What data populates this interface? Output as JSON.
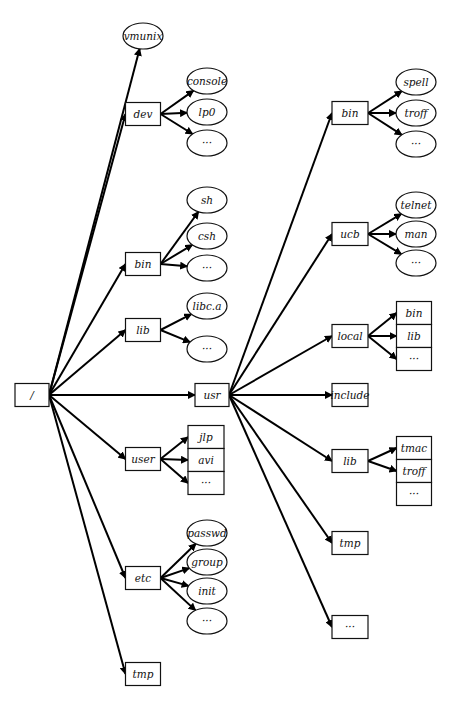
{
  "diagram": {
    "type": "unix-filesystem-tree",
    "root": {
      "id": "root",
      "label": "/",
      "shape": "box",
      "x": 32,
      "y": 395,
      "w": 34,
      "h": 23
    },
    "nodes": [
      {
        "id": "vmunix",
        "label": "vmunix",
        "shape": "ellipse",
        "x": 143,
        "y": 36,
        "w": 40,
        "h": 26,
        "parent": "root"
      },
      {
        "id": "dev",
        "label": "dev",
        "shape": "box",
        "x": 143,
        "y": 114,
        "w": 35,
        "h": 23,
        "parent": "root"
      },
      {
        "id": "dev-console",
        "label": "console",
        "shape": "ellipse",
        "x": 207,
        "y": 81,
        "w": 40,
        "h": 26,
        "parent": "dev"
      },
      {
        "id": "dev-lp0",
        "label": "lp0",
        "shape": "ellipse",
        "x": 207,
        "y": 112,
        "w": 40,
        "h": 26,
        "parent": "dev"
      },
      {
        "id": "dev-more",
        "label": "···",
        "shape": "ellipse",
        "x": 207,
        "y": 143,
        "w": 40,
        "h": 26,
        "parent": "dev"
      },
      {
        "id": "bin",
        "label": "bin",
        "shape": "box",
        "x": 143,
        "y": 264,
        "w": 35,
        "h": 23,
        "parent": "root"
      },
      {
        "id": "bin-sh",
        "label": "sh",
        "shape": "ellipse",
        "x": 207,
        "y": 200,
        "w": 40,
        "h": 26,
        "parent": "bin"
      },
      {
        "id": "bin-csh",
        "label": "csh",
        "shape": "ellipse",
        "x": 207,
        "y": 236,
        "w": 40,
        "h": 26,
        "parent": "bin"
      },
      {
        "id": "bin-more",
        "label": "···",
        "shape": "ellipse",
        "x": 207,
        "y": 268,
        "w": 40,
        "h": 26,
        "parent": "bin"
      },
      {
        "id": "lib",
        "label": "lib",
        "shape": "box",
        "x": 143,
        "y": 330,
        "w": 35,
        "h": 23,
        "parent": "root"
      },
      {
        "id": "lib-libca",
        "label": "libc.a",
        "shape": "ellipse",
        "x": 207,
        "y": 306,
        "w": 40,
        "h": 26,
        "parent": "lib"
      },
      {
        "id": "lib-more",
        "label": "···",
        "shape": "ellipse",
        "x": 207,
        "y": 349,
        "w": 40,
        "h": 26,
        "parent": "lib"
      },
      {
        "id": "usr",
        "label": "usr",
        "shape": "box",
        "x": 212,
        "y": 395,
        "w": 34,
        "h": 23,
        "parent": "root"
      },
      {
        "id": "user",
        "label": "user",
        "shape": "box",
        "x": 143,
        "y": 459,
        "w": 35,
        "h": 23,
        "parent": "root"
      },
      {
        "id": "user-jlp",
        "label": "jlp",
        "shape": "stackbox",
        "x": 206,
        "y": 437,
        "w": 36,
        "h": 23,
        "parent": "user"
      },
      {
        "id": "user-avi",
        "label": "avi",
        "shape": "stackbox",
        "x": 206,
        "y": 460,
        "w": 36,
        "h": 23,
        "parent": "user"
      },
      {
        "id": "user-more",
        "label": "···",
        "shape": "stackbox",
        "x": 206,
        "y": 483,
        "w": 36,
        "h": 23,
        "parent": "user"
      },
      {
        "id": "etc",
        "label": "etc",
        "shape": "box",
        "x": 143,
        "y": 578,
        "w": 35,
        "h": 23,
        "parent": "root"
      },
      {
        "id": "etc-passwd",
        "label": "passwd",
        "shape": "ellipse",
        "x": 207,
        "y": 533,
        "w": 40,
        "h": 26,
        "parent": "etc"
      },
      {
        "id": "etc-group",
        "label": "group",
        "shape": "ellipse",
        "x": 207,
        "y": 562,
        "w": 40,
        "h": 26,
        "parent": "etc"
      },
      {
        "id": "etc-init",
        "label": "init",
        "shape": "ellipse",
        "x": 207,
        "y": 591,
        "w": 40,
        "h": 26,
        "parent": "etc"
      },
      {
        "id": "etc-more",
        "label": "···",
        "shape": "ellipse",
        "x": 207,
        "y": 621,
        "w": 40,
        "h": 26,
        "parent": "etc"
      },
      {
        "id": "tmp",
        "label": "tmp",
        "shape": "box",
        "x": 143,
        "y": 674,
        "w": 35,
        "h": 23,
        "parent": "root"
      },
      {
        "id": "usr-bin",
        "label": "bin",
        "shape": "box",
        "x": 350,
        "y": 113,
        "w": 36,
        "h": 23,
        "parent": "usr"
      },
      {
        "id": "usr-bin-spell",
        "label": "spell",
        "shape": "ellipse",
        "x": 416,
        "y": 82,
        "w": 40,
        "h": 26,
        "parent": "usr-bin"
      },
      {
        "id": "usr-bin-troff",
        "label": "troff",
        "shape": "ellipse",
        "x": 416,
        "y": 113,
        "w": 40,
        "h": 26,
        "parent": "usr-bin"
      },
      {
        "id": "usr-bin-more",
        "label": "···",
        "shape": "ellipse",
        "x": 416,
        "y": 144,
        "w": 40,
        "h": 26,
        "parent": "usr-bin"
      },
      {
        "id": "usr-ucb",
        "label": "ucb",
        "shape": "box",
        "x": 350,
        "y": 234,
        "w": 36,
        "h": 23,
        "parent": "usr"
      },
      {
        "id": "usr-ucb-telnet",
        "label": "telnet",
        "shape": "ellipse",
        "x": 416,
        "y": 205,
        "w": 40,
        "h": 26,
        "parent": "usr-ucb"
      },
      {
        "id": "usr-ucb-man",
        "label": "man",
        "shape": "ellipse",
        "x": 416,
        "y": 234,
        "w": 40,
        "h": 26,
        "parent": "usr-ucb"
      },
      {
        "id": "usr-ucb-more",
        "label": "···",
        "shape": "ellipse",
        "x": 416,
        "y": 263,
        "w": 40,
        "h": 26,
        "parent": "usr-ucb"
      },
      {
        "id": "usr-local",
        "label": "local",
        "shape": "box",
        "x": 350,
        "y": 336,
        "w": 36,
        "h": 23,
        "parent": "usr"
      },
      {
        "id": "usr-local-bin",
        "label": "bin",
        "shape": "stackbox",
        "x": 414,
        "y": 313,
        "w": 35,
        "h": 23,
        "parent": "usr-local"
      },
      {
        "id": "usr-local-lib",
        "label": "lib",
        "shape": "stackbox",
        "x": 414,
        "y": 336,
        "w": 35,
        "h": 23,
        "parent": "usr-local"
      },
      {
        "id": "usr-local-more",
        "label": "···",
        "shape": "stackbox",
        "x": 414,
        "y": 359,
        "w": 35,
        "h": 23,
        "parent": "usr-local"
      },
      {
        "id": "usr-include",
        "label": "include",
        "shape": "box",
        "x": 350,
        "y": 395,
        "w": 36,
        "h": 23,
        "parent": "usr"
      },
      {
        "id": "usr-lib",
        "label": "lib",
        "shape": "box",
        "x": 350,
        "y": 461,
        "w": 36,
        "h": 23,
        "parent": "usr"
      },
      {
        "id": "usr-lib-tmac",
        "label": "tmac",
        "shape": "stackbox",
        "x": 414,
        "y": 448,
        "w": 35,
        "h": 23,
        "parent": "usr-lib"
      },
      {
        "id": "usr-lib-troff",
        "label": "troff",
        "shape": "stackbox",
        "x": 414,
        "y": 471,
        "w": 35,
        "h": 23,
        "parent": "usr-lib"
      },
      {
        "id": "usr-lib-more",
        "label": "···",
        "shape": "stackbox",
        "x": 414,
        "y": 494,
        "w": 35,
        "h": 23,
        "parent": "usr-lib",
        "noArrow": true
      },
      {
        "id": "usr-tmp",
        "label": "tmp",
        "shape": "box",
        "x": 350,
        "y": 543,
        "w": 36,
        "h": 23,
        "parent": "usr"
      },
      {
        "id": "usr-more",
        "label": "···",
        "shape": "box",
        "x": 350,
        "y": 627,
        "w": 36,
        "h": 23,
        "parent": "usr"
      }
    ]
  }
}
